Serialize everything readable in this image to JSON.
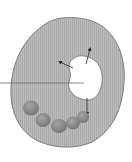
{
  "diagram": {
    "type": "cell-illustration",
    "colors": {
      "background": "#ffffff",
      "cytoplasm": "#b9b9b9",
      "cell_outline": "#7a7a7a",
      "vacuole": "#ffffff",
      "vacuole_outline": "#6e6e6e",
      "organelle": "#8a8a8a",
      "organelle_highlight": "#a8a8a8",
      "arrow": "#222222",
      "label_line": "#6a6a6a"
    },
    "parts": [
      {
        "name": "cell-body",
        "label": ""
      },
      {
        "name": "vacuole",
        "label": ""
      },
      {
        "name": "organelle-chain",
        "count": 5,
        "label": ""
      },
      {
        "name": "arrows",
        "count": 3,
        "directions": [
          "up-left",
          "up",
          "down"
        ]
      },
      {
        "name": "label-pointer-line",
        "label": ""
      }
    ]
  }
}
